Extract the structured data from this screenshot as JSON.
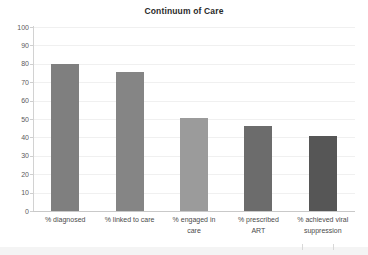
{
  "chart_data": {
    "type": "bar",
    "title": "Continuum of Care",
    "xlabel": "",
    "ylabel": "",
    "ylim": [
      0,
      100
    ],
    "yticks": [
      0,
      10,
      20,
      30,
      40,
      50,
      60,
      70,
      80,
      90,
      100
    ],
    "grid": true,
    "legend": false,
    "categories": [
      "% diagnosed",
      "% linked to care",
      "% engaged in care",
      "% prescribed ART",
      "% achieved viral suppression"
    ],
    "category_lines": [
      [
        "% diagnosed"
      ],
      [
        "% linked to care"
      ],
      [
        "% engaged in",
        "care"
      ],
      [
        "% prescribed",
        "ART"
      ],
      [
        "% achieved viral",
        "suppression"
      ]
    ],
    "values": [
      80,
      75.5,
      50.5,
      46,
      41
    ],
    "bar_colors": [
      "#7f7f7f",
      "#858585",
      "#9b9b9b",
      "#6c6c6c",
      "#565656"
    ]
  },
  "axis": {
    "tick_labels": [
      "100",
      "90",
      "80",
      "70",
      "60",
      "50",
      "40",
      "30",
      "20",
      "10",
      "0"
    ]
  },
  "colors": {
    "gridline": "#f0f0f0",
    "axis": "#d2d2d2",
    "title_text": "#2a2a2a",
    "tick_text": "#5c5c5c",
    "label_text": "#4a4a4a",
    "background": "#ffffff"
  }
}
